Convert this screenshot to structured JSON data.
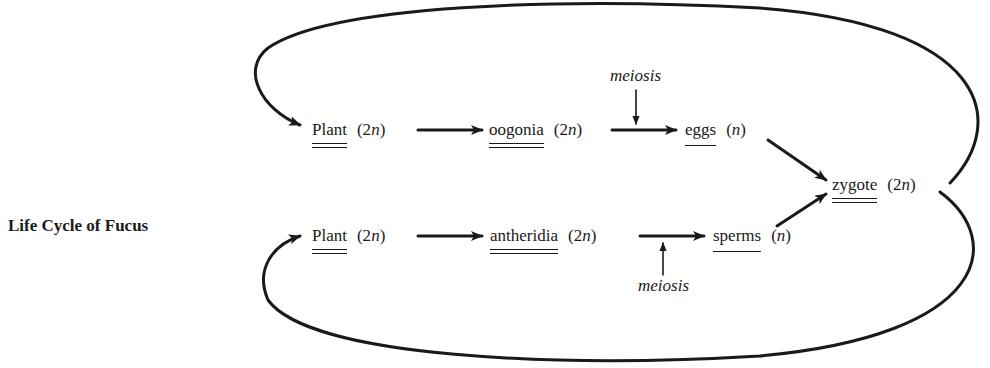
{
  "title": "Life Cycle of Fucus",
  "nodes": {
    "plant_top": {
      "name": "Plant",
      "ploidy_prefix": "(2",
      "ploidy_var": "n",
      "ploidy_suffix": ")",
      "underline": "double"
    },
    "oogonia": {
      "name": "oogonia",
      "ploidy_prefix": "(2",
      "ploidy_var": "n",
      "ploidy_suffix": ")",
      "underline": "double"
    },
    "eggs": {
      "name": "eggs",
      "ploidy_prefix": "(",
      "ploidy_var": "n",
      "ploidy_suffix": ")",
      "underline": "single"
    },
    "zygote": {
      "name": "zygote",
      "ploidy_prefix": "(2",
      "ploidy_var": "n",
      "ploidy_suffix": ")",
      "underline": "double"
    },
    "plant_bottom": {
      "name": "Plant",
      "ploidy_prefix": "(2",
      "ploidy_var": "n",
      "ploidy_suffix": ")",
      "underline": "double"
    },
    "antheridia": {
      "name": "antheridia",
      "ploidy_prefix": "(2",
      "ploidy_var": "n",
      "ploidy_suffix": ")",
      "underline": "double"
    },
    "sperms": {
      "name": "sperms",
      "ploidy_prefix": "(",
      "ploidy_var": "n",
      "ploidy_suffix": ")",
      "underline": "single"
    }
  },
  "labels": {
    "meiosis_top": "meiosis",
    "meiosis_bottom": "meiosis"
  },
  "edges": [
    {
      "from": "plant_top",
      "to": "oogonia"
    },
    {
      "from": "oogonia",
      "to": "eggs",
      "annotation": "meiosis"
    },
    {
      "from": "eggs",
      "to": "zygote"
    },
    {
      "from": "plant_bottom",
      "to": "antheridia"
    },
    {
      "from": "antheridia",
      "to": "sperms",
      "annotation": "meiosis"
    },
    {
      "from": "sperms",
      "to": "zygote"
    },
    {
      "from": "zygote",
      "to": "plant_top",
      "type": "loop"
    },
    {
      "from": "zygote",
      "to": "plant_bottom",
      "type": "loop"
    }
  ],
  "colors": {
    "ink": "#1a1a1a",
    "background": "#ffffff"
  }
}
